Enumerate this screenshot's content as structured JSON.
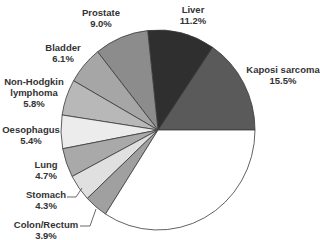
{
  "chart_data": {
    "type": "pie",
    "title": "",
    "start": "3 o'clock, slices proceed counterclockwise",
    "slices": [
      {
        "label": "Kaposi sarcoma",
        "value": 15.5,
        "pct": "15.5%",
        "color": "#5a5a5a"
      },
      {
        "label": "Liver",
        "value": 11.2,
        "pct": "11.2%",
        "color": "#2f2f2f"
      },
      {
        "label": "Prostate",
        "value": 9.0,
        "pct": "9.0%",
        "color": "#8c8c8c"
      },
      {
        "label": "Bladder",
        "value": 6.1,
        "pct": "6.1%",
        "color": "#a6a6a6"
      },
      {
        "label": "Non-Hodgkin lymphoma",
        "value": 5.8,
        "pct": "5.8%",
        "color": "#b8b8b8"
      },
      {
        "label": "Oesophagus",
        "value": 5.4,
        "pct": "5.4%",
        "color": "#ececec"
      },
      {
        "label": "Lung",
        "value": 4.7,
        "pct": "4.7%",
        "color": "#a9a9a9"
      },
      {
        "label": "Stomach",
        "value": 4.3,
        "pct": "4.3%",
        "color": "#e0e0e0"
      },
      {
        "label": "Colon/Rectum",
        "value": 3.9,
        "pct": "3.9%",
        "color": "#a0a0a0"
      },
      {
        "label": "",
        "value": 34.1,
        "pct": "",
        "color": "#ffffff"
      }
    ]
  },
  "labels": [
    {
      "name": "Kaposi sarcoma",
      "pct": "15.5%",
      "x": 283,
      "y": 64
    },
    {
      "name": "Liver",
      "pct": "11.2%",
      "x": 193,
      "y": 4
    },
    {
      "name": "Prostate",
      "pct": "9.0%",
      "x": 101,
      "y": 7
    },
    {
      "name": "Bladder",
      "pct": "6.1%",
      "x": 63,
      "y": 42
    },
    {
      "name": "Non-Hodgkin",
      "name2": "lymphoma",
      "pct": "5.8%",
      "x": 34,
      "y": 76
    },
    {
      "name": "Oesophagus",
      "pct": "5.4%",
      "x": 31,
      "y": 124
    },
    {
      "name": "Lung",
      "pct": "4.7%",
      "x": 46,
      "y": 159
    },
    {
      "name": "Stomach",
      "pct": "4.3%",
      "x": 46,
      "y": 189
    },
    {
      "name": "Colon/Rectum",
      "pct": "3.9%",
      "x": 46,
      "y": 219
    }
  ]
}
